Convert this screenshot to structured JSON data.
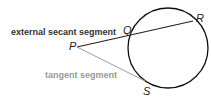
{
  "labels": {
    "secant": "external secant segment",
    "tangent": "tangent segment"
  },
  "points": {
    "P": "P",
    "Q": "Q",
    "R": "R",
    "S": "S"
  },
  "colors": {
    "secant": "#222222",
    "tangent": "#999999",
    "circle": "#111111"
  }
}
